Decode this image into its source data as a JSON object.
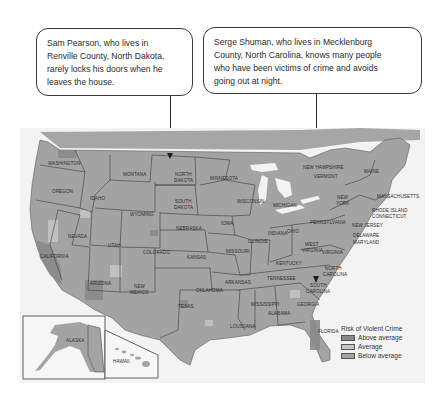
{
  "callouts": [
    {
      "text": "Sam Pearson, who lives in\nRenville County, North Dakota,\nrarely locks his doors when he\nleaves the house.",
      "points_to": "North Dakota"
    },
    {
      "text": "Serge Shuman, who lives in Mecklenburg\nCounty, North Carolina, knows many people\nwho have been victims of crime and avoids\ngoing out at night.",
      "points_to": "North Carolina"
    }
  ],
  "map": {
    "state_labels": {
      "washington": "WASHINGTON",
      "oregon": "OREGON",
      "california": "CALIFORNIA",
      "idaho": "IDAHO",
      "nevada": "NEVADA",
      "montana": "MONTANA",
      "wyoming": "WYOMING",
      "utah": "UTAH",
      "arizona": "ARIZONA",
      "colorado": "COLORADO",
      "new_mexico_1": "NEW",
      "new_mexico_2": "MEXICO",
      "north_dakota_1": "NORTH",
      "north_dakota_2": "DAKOTA",
      "south_dakota_1": "SOUTH",
      "south_dakota_2": "DAKOTA",
      "nebraska": "NEBRASKA",
      "kansas": "KANSAS",
      "oklahoma": "OKLAHOMA",
      "texas": "TEXAS",
      "minnesota": "MINNESOTA",
      "iowa": "IOWA",
      "missouri": "MISSOURI",
      "arkansas": "ARKANSAS",
      "louisiana": "LOUISIANA",
      "wisconsin": "WISCONSIN",
      "illinois": "ILLINOIS",
      "michigan": "MICHIGAN",
      "indiana": "INDIANA",
      "ohio": "OHIO",
      "kentucky": "KENTUCKY",
      "tennessee": "TENNESSEE",
      "mississippi": "MISSISSIPPI",
      "alabama": "ALABAMA",
      "georgia": "GEORGIA",
      "florida": "FLORIDA",
      "south_carolina_1": "SOUTH",
      "south_carolina_2": "CAROLINA",
      "north_carolina_1": "NORTH",
      "north_carolina_2": "CAROLINA",
      "virginia": "VIRGINIA",
      "west_virginia_1": "WEST",
      "west_virginia_2": "VIRGINIA",
      "pennsylvania": "PENNSYLVANIA",
      "new_york_1": "NEW",
      "new_york_2": "YORK",
      "new_jersey": "NEW JERSEY",
      "delaware": "DELAWARE",
      "maryland": "MARYLAND",
      "connecticut": "CONNECTICUT",
      "rhode_island": "RHODE ISLAND",
      "massachusetts": "MASSACHUSETTS",
      "vermont": "VERMONT",
      "new_hampshire": "NEW HAMPSHIRE",
      "maine": "MAINE",
      "alaska": "ALASKA",
      "hawaii": "HAWAII"
    }
  },
  "legend": {
    "title": "Risk of Violent Crime",
    "items": [
      {
        "label": "Above average",
        "color": "#8a8a8a"
      },
      {
        "label": "Average",
        "color": "#c4c4c4"
      },
      {
        "label": "Below average",
        "color": "#a4a4a4"
      }
    ]
  },
  "colors": {
    "land": "#a3a3a3",
    "land_dark": "#8a8a8a",
    "land_light": "#c4c4c4",
    "water": "#f3f3f3",
    "border": "#3a3a3a"
  }
}
